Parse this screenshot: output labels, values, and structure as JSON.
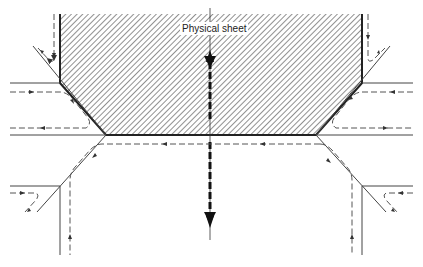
{
  "diagram": {
    "title_label": "Physical sheet",
    "colors": {
      "line": "#333333",
      "hatch": "#555555",
      "background": "#ffffff"
    },
    "elements": {
      "sheet_region": "hatched-polygon",
      "center_axis": "double-headed-bold-dashed-arrow",
      "flow_paths": "dashed-arrow-paths"
    }
  }
}
